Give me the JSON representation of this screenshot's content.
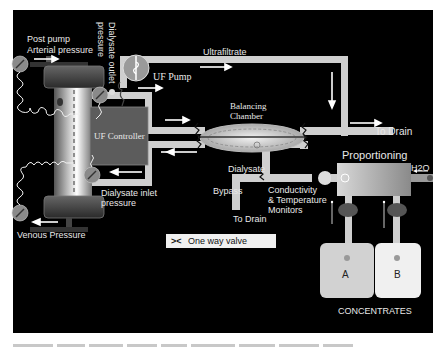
{
  "diagram": {
    "colors": {
      "background": "#000000",
      "tubing": "#cfcfcf",
      "controller": "#5c5c5c",
      "gauge": "#8a8a8a",
      "arrow": "#ffffff",
      "text": "#e8e8e8"
    },
    "labels": {
      "post_pump_line1": "Post pump",
      "post_pump_line2": "Arterial pressure",
      "dialysate_outlet_line1": "Dialysate outlet",
      "dialysate_outlet_line2": "pressure",
      "ultrafiltrate": "Ultrafiltrate",
      "uf_pump": "UF Pump",
      "balancing_line1": "Balancing",
      "balancing_line2": "Chamber",
      "to_drain_top": "To Drain",
      "uf_controller": "UF Controller",
      "dialysate": "Dialysate",
      "proportioning": "Proportioning",
      "h2o": "H2O",
      "dialysate_inlet_line1": "Dialysate inlet",
      "dialysate_inlet_line2": "pressure",
      "bypass": "Bypass",
      "conductivity_line1": "Conductivity",
      "conductivity_line2": "& Temperature",
      "conductivity_line3": "Monitors",
      "to_drain_bottom": "To Drain",
      "venous_pressure": "Venous Pressure",
      "concentrate_a": "A",
      "concentrate_b": "B",
      "concentrates": "CONCENTRATES"
    },
    "legend": {
      "symbol": "><",
      "text": "One way valve"
    }
  }
}
